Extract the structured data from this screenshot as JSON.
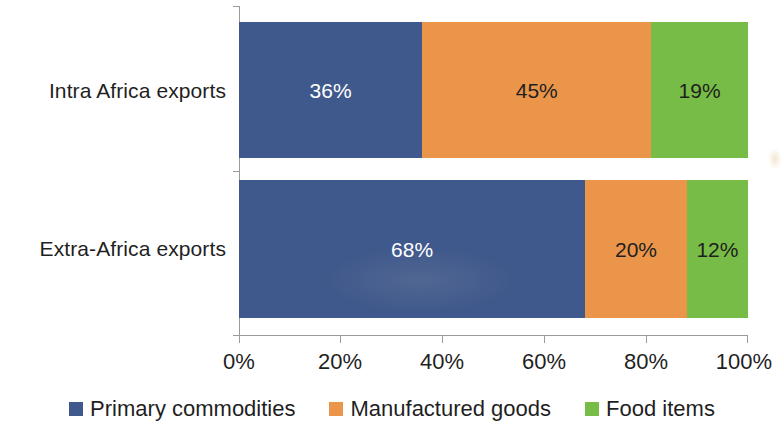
{
  "chart_data": {
    "type": "bar",
    "orientation": "horizontal",
    "stacked": true,
    "stack_mode": "percent",
    "title": "",
    "subtitle": "",
    "xlabel": "",
    "ylabel": "",
    "xlim": [
      0,
      100
    ],
    "x_tick_labels": [
      "0%",
      "20%",
      "40%",
      "60%",
      "80%",
      "100%"
    ],
    "x_tick_values": [
      0,
      20,
      40,
      60,
      80,
      100
    ],
    "grid": false,
    "legend_position": "bottom",
    "categories": [
      "Intra Africa exports",
      "Extra-Africa exports"
    ],
    "series": [
      {
        "name": "Primary commodities",
        "color": "#40598c",
        "label_color": "#ffffff",
        "values": [
          36,
          68
        ],
        "value_labels": [
          "36%",
          "68%"
        ]
      },
      {
        "name": "Manufactured goods",
        "color": "#eb954b",
        "label_color": "#1f1f1f",
        "values": [
          45,
          20
        ],
        "value_labels": [
          "45%",
          "20%"
        ]
      },
      {
        "name": "Food items",
        "color": "#77bc47",
        "label_color": "#1f1f1f",
        "values": [
          19,
          12
        ],
        "value_labels": [
          "19%",
          "12%"
        ]
      }
    ]
  },
  "axis": {
    "tick_0": "0%",
    "tick_1": "20%",
    "tick_2": "40%",
    "tick_3": "60%",
    "tick_4": "80%",
    "tick_5": "100%"
  },
  "categories": {
    "cat_0": "Intra Africa exports",
    "cat_1": "Extra-Africa exports"
  },
  "bars": {
    "row_0": {
      "seg_0": "36%",
      "seg_1": "45%",
      "seg_2": "19%"
    },
    "row_1": {
      "seg_0": "68%",
      "seg_1": "20%",
      "seg_2": "12%"
    }
  },
  "legend": {
    "item_0": "Primary commodities",
    "item_1": "Manufactured goods",
    "item_2": "Food items"
  },
  "colors": {
    "primary_commodities": "#40598c",
    "manufactured_goods": "#eb954b",
    "food_items": "#77bc47",
    "axis": "#9a9a9a",
    "text": "#1f1f1f",
    "background": "#ffffff"
  }
}
